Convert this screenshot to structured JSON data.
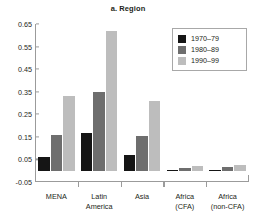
{
  "chart_data": {
    "type": "bar",
    "title": "a. Region",
    "xlabel": "",
    "ylabel": "",
    "ylim": [
      -0.05,
      0.65
    ],
    "ytick_values": [
      -0.05,
      0.05,
      0.15,
      0.25,
      0.35,
      0.45,
      0.55,
      0.65
    ],
    "ytick_labels": [
      "-0.05",
      "0.05",
      "0.15",
      "0.25",
      "0.35",
      "0.45",
      "0.55",
      "0.65"
    ],
    "grid": false,
    "legend_position": "top-right",
    "categories": [
      "MENA",
      "Latin America",
      "Asia",
      "Africa (CFA)",
      "Africa (non-CFA)"
    ],
    "category_lines": [
      [
        "MENA"
      ],
      [
        "Latin",
        "America"
      ],
      [
        "Asia"
      ],
      [
        "Africa",
        "(CFA)"
      ],
      [
        "Africa",
        "(non-CFA)"
      ]
    ],
    "series": [
      {
        "name": "1970–79",
        "color": "#151515",
        "values": [
          0.06,
          0.165,
          0.07,
          0.004,
          0.004
        ]
      },
      {
        "name": "1980–89",
        "color": "#6e6e6e",
        "values": [
          0.16,
          0.348,
          0.155,
          0.012,
          0.018
        ]
      },
      {
        "name": "1990–99",
        "color": "#bdbdbd",
        "values": [
          0.33,
          0.62,
          0.31,
          0.022,
          0.025
        ]
      }
    ]
  },
  "colors": {
    "axis": "#9b9b9b",
    "text": "#231f20",
    "background": "#ffffff",
    "legend_border": "#a8a8a8"
  }
}
